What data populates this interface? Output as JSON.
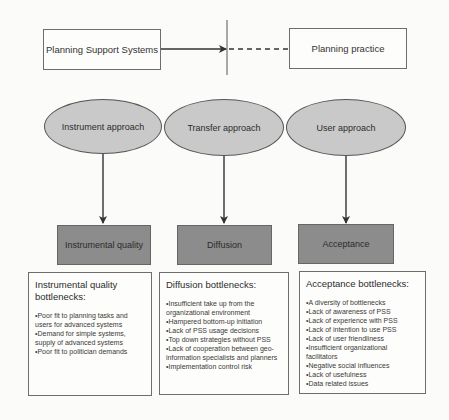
{
  "diagram": {
    "top": {
      "source_box": "Planning Support Systems",
      "target_box": "Planning practice"
    },
    "approaches": [
      {
        "ellipse": "Instrument approach",
        "outcome": "Instrumental quality",
        "bottleneck_title": "Instrumental quality bottlenecks:",
        "bottlenecks": [
          "Poor fit to planning tasks and users for advanced systems",
          "Demand for simple systems, supply of advanced systems",
          "Poor fit to politician demands"
        ]
      },
      {
        "ellipse": "Transfer approach",
        "outcome": "Diffusion",
        "bottleneck_title": "Diffusion bottlenecks:",
        "bottlenecks": [
          "Insufficient take up from the organizational environment",
          "Hampered bottom-up initiation",
          "Lack of PSS usage decisions",
          "Top down strategies without PSS",
          "Lack of cooperation between geo-information specialists and planners",
          "Implementation control risk"
        ]
      },
      {
        "ellipse": "User approach",
        "outcome": "Acceptance",
        "bottleneck_title": "Acceptance bottlenecks:",
        "bottlenecks": [
          "A diversity of bottlenecks",
          "Lack of awareness of PSS",
          "Lack of experience with PSS",
          "Lack of intention to use PSS",
          "Lack of user friendliness",
          "Insufficient organizational facilitators",
          "Negative social influences",
          "Lack of usefulness",
          "Data related issues"
        ]
      }
    ],
    "colors": {
      "ellipse_fill": "#c9c9c9",
      "outcome_fill": "#8c8c8c",
      "line": "#333333"
    }
  }
}
